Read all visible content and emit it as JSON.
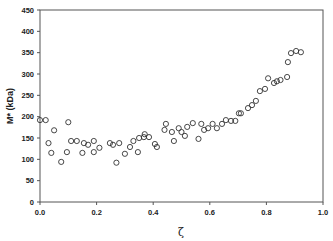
{
  "chart_data": {
    "type": "scatter",
    "title": "",
    "xlabel": "ζ",
    "ylabel": "M* (kDa)",
    "xlim": [
      0.0,
      1.0
    ],
    "ylim": [
      0,
      450
    ],
    "x_ticks": [
      "0.0",
      "0.2",
      "0.4",
      "0.6",
      "0.8",
      "1.0"
    ],
    "y_ticks": [
      "0",
      "50",
      "100",
      "150",
      "200",
      "250",
      "300",
      "350",
      "400",
      "450"
    ],
    "grid": false,
    "legend": null,
    "marker": "open-circle",
    "series": [
      {
        "name": "M*",
        "points": [
          [
            0.0,
            192
          ],
          [
            0.02,
            192
          ],
          [
            0.03,
            138
          ],
          [
            0.04,
            115
          ],
          [
            0.05,
            168
          ],
          [
            0.075,
            94
          ],
          [
            0.095,
            117
          ],
          [
            0.1,
            187
          ],
          [
            0.11,
            143
          ],
          [
            0.13,
            143
          ],
          [
            0.15,
            115
          ],
          [
            0.155,
            138
          ],
          [
            0.17,
            134
          ],
          [
            0.19,
            143
          ],
          [
            0.19,
            117
          ],
          [
            0.21,
            127
          ],
          [
            0.247,
            138
          ],
          [
            0.258,
            134
          ],
          [
            0.27,
            92
          ],
          [
            0.28,
            138
          ],
          [
            0.3,
            113
          ],
          [
            0.318,
            129
          ],
          [
            0.33,
            143
          ],
          [
            0.346,
            117
          ],
          [
            0.35,
            150
          ],
          [
            0.367,
            152
          ],
          [
            0.37,
            159
          ],
          [
            0.385,
            152
          ],
          [
            0.406,
            136
          ],
          [
            0.413,
            129
          ],
          [
            0.44,
            169
          ],
          [
            0.445,
            183
          ],
          [
            0.466,
            164
          ],
          [
            0.473,
            143
          ],
          [
            0.49,
            173
          ],
          [
            0.5,
            164
          ],
          [
            0.512,
            155
          ],
          [
            0.52,
            176
          ],
          [
            0.54,
            185
          ],
          [
            0.56,
            148
          ],
          [
            0.57,
            183
          ],
          [
            0.58,
            169
          ],
          [
            0.594,
            173
          ],
          [
            0.61,
            183
          ],
          [
            0.625,
            173
          ],
          [
            0.643,
            183
          ],
          [
            0.657,
            192
          ],
          [
            0.675,
            190
          ],
          [
            0.69,
            190
          ],
          [
            0.703,
            208
          ],
          [
            0.71,
            208
          ],
          [
            0.735,
            220
          ],
          [
            0.749,
            227
          ],
          [
            0.763,
            237
          ],
          [
            0.777,
            260
          ],
          [
            0.795,
            265
          ],
          [
            0.806,
            290
          ],
          [
            0.827,
            279
          ],
          [
            0.837,
            283
          ],
          [
            0.85,
            286
          ],
          [
            0.873,
            293
          ],
          [
            0.876,
            328
          ],
          [
            0.887,
            349
          ],
          [
            0.905,
            354
          ],
          [
            0.922,
            351
          ]
        ]
      }
    ]
  }
}
